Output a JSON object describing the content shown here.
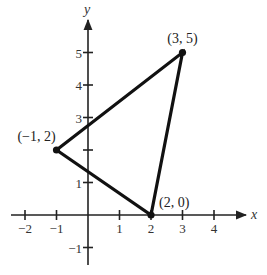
{
  "chart_data": {
    "type": "line",
    "title": "",
    "xlabel": "x",
    "ylabel": "y",
    "xlim": [
      -2.5,
      5
    ],
    "ylim": [
      -1.5,
      6
    ],
    "grid": false,
    "x_ticks": [
      -2,
      -1,
      1,
      2,
      3,
      4
    ],
    "y_ticks": [
      -1,
      1,
      2,
      3,
      4,
      5
    ],
    "x_tick_labels": [
      "−2",
      "−1",
      "1",
      "2",
      "3",
      "4"
    ],
    "y_tick_labels": [
      "−1",
      "1",
      "2",
      "3",
      "4",
      "5"
    ],
    "series": [
      {
        "name": "triangle",
        "closed": true,
        "points": [
          {
            "x": -1,
            "y": 2,
            "label": "(−1, 2)"
          },
          {
            "x": 3,
            "y": 5,
            "label": "(3, 5)"
          },
          {
            "x": 2,
            "y": 0,
            "label": "(2, 0)"
          }
        ]
      }
    ]
  },
  "colors": {
    "axis": "#222222",
    "line": "#111111",
    "text": "#333333"
  }
}
